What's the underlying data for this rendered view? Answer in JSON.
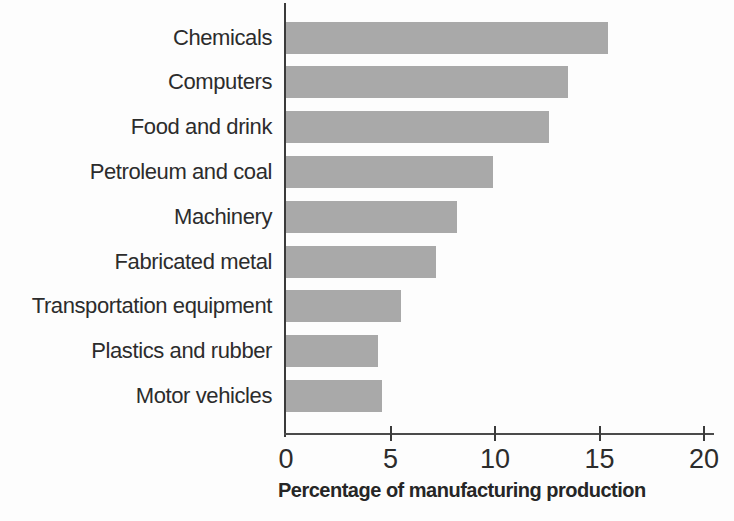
{
  "chart_data": {
    "type": "bar",
    "orientation": "horizontal",
    "title": "",
    "xlabel": "Percentage of manufacturing production",
    "ylabel": "",
    "categories": [
      "Chemicals",
      "Computers",
      "Food and drink",
      "Petroleum and coal",
      "Machinery",
      "Fabricated metal",
      "Transportation equipment",
      "Plastics and rubber",
      "Motor vehicles"
    ],
    "values": [
      15.4,
      13.5,
      12.6,
      9.9,
      8.2,
      7.2,
      5.5,
      4.4,
      4.6
    ],
    "xlim": [
      0,
      20.5
    ],
    "xticks": [
      0,
      5,
      10,
      15,
      20
    ],
    "grid": false,
    "legend": "none",
    "bar_color": "#a9a9a9",
    "axis_color": "#3b3b3b",
    "text_color": "#2c2c2c"
  }
}
